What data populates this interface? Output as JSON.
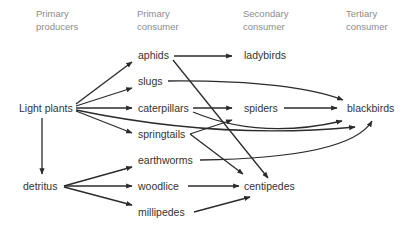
{
  "headers": {
    "producers": {
      "line1": "Primary",
      "line2": "producers"
    },
    "primary": {
      "line1": "Primary",
      "line2": "consumer"
    },
    "secondary": {
      "line1": "Secondary",
      "line2": "consumer"
    },
    "tertiary": {
      "line1": "Tertiary",
      "line2": "consumer"
    }
  },
  "nodes": {
    "light_plants": "Light plants",
    "detritus": "detritus",
    "aphids": "aphids",
    "slugs": "slugs",
    "caterpillars": "caterpillars",
    "springtails": "springtails",
    "earthworms": "earthworms",
    "woodlice": "woodlice",
    "millipedes": "millipedes",
    "ladybirds": "ladybirds",
    "spiders": "spiders",
    "centipedes": "centipedes",
    "blackbirds": "blackbirds"
  },
  "edges": [
    {
      "from": "Light plants",
      "to": "aphids"
    },
    {
      "from": "Light plants",
      "to": "slugs"
    },
    {
      "from": "Light plants",
      "to": "caterpillars"
    },
    {
      "from": "Light plants",
      "to": "springtails"
    },
    {
      "from": "Light plants",
      "to": "blackbirds"
    },
    {
      "from": "Light plants",
      "to": "detritus"
    },
    {
      "from": "detritus",
      "to": "earthworms"
    },
    {
      "from": "detritus",
      "to": "woodlice"
    },
    {
      "from": "detritus",
      "to": "millipedes"
    },
    {
      "from": "aphids",
      "to": "ladybirds"
    },
    {
      "from": "aphids",
      "to": "centipedes"
    },
    {
      "from": "slugs",
      "to": "blackbirds"
    },
    {
      "from": "caterpillars",
      "to": "spiders"
    },
    {
      "from": "caterpillars",
      "to": "blackbirds"
    },
    {
      "from": "springtails",
      "to": "spiders"
    },
    {
      "from": "springtails",
      "to": "centipedes"
    },
    {
      "from": "spiders",
      "to": "blackbirds"
    },
    {
      "from": "earthworms",
      "to": "blackbirds"
    },
    {
      "from": "woodlice",
      "to": "centipedes"
    },
    {
      "from": "millipedes",
      "to": "centipedes"
    }
  ],
  "colors": {
    "line": "#2b2b2b",
    "header_text": "#8c8c8c",
    "node_text": "#333333"
  }
}
